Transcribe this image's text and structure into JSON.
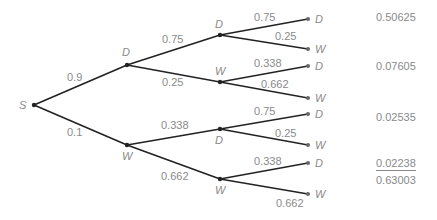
{
  "tree": {
    "root": "S",
    "level1": [
      {
        "label": "D",
        "prob": "0.9"
      },
      {
        "label": "W",
        "prob": "0.1"
      }
    ],
    "level2": [
      {
        "label": "D",
        "prob": "0.75"
      },
      {
        "label": "W",
        "prob": "0.25"
      },
      {
        "label": "D",
        "prob": "0.338"
      },
      {
        "label": "W",
        "prob": "0.662"
      }
    ],
    "leaves": [
      {
        "label": "D",
        "prob": "0.75"
      },
      {
        "label": "W",
        "prob": "0.25"
      },
      {
        "label": "D",
        "prob": "0.338"
      },
      {
        "label": "W",
        "prob": "0.662"
      },
      {
        "label": "D",
        "prob": "0.75"
      },
      {
        "label": "W",
        "prob": "0.25"
      },
      {
        "label": "D",
        "prob": "0.338"
      },
      {
        "label": "W",
        "prob": "0.662"
      }
    ]
  },
  "results": [
    "0.50625",
    "0.07605",
    "0.02535",
    "0.02238"
  ],
  "total": "0.63003"
}
